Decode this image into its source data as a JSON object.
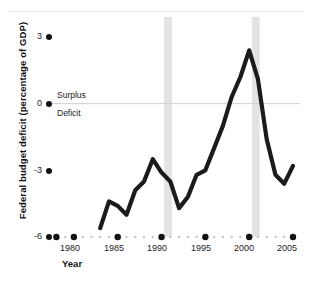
{
  "chart_data": {
    "type": "line",
    "title": "",
    "xlabel": "Year",
    "ylabel": "Federal budget deficit (percentage of GDP)",
    "xlim": [
      1977.5,
      2005.8
    ],
    "ylim": [
      -6,
      3
    ],
    "grid": false,
    "legend": "none",
    "yticks": [
      3,
      0,
      -3,
      -6
    ],
    "ytick_labels": [
      "3",
      "0",
      "-3",
      "-6"
    ],
    "xticks": [
      1980,
      1985,
      1990,
      1995,
      2000,
      2005
    ],
    "xtick_labels": [
      "1980",
      "1985",
      "1990",
      "1995",
      "2000",
      "2005"
    ],
    "zero_line": 0,
    "annotations": [
      {
        "text": "Surplus",
        "x": 1982,
        "y": 0.55
      },
      {
        "text": "Deficit",
        "x": 1982,
        "y": -0.75
      }
    ],
    "shaded_bands": [
      {
        "label": "recession",
        "x0": 1990.3,
        "x1": 1991.2,
        "color": "#e3e3e3"
      },
      {
        "label": "recession",
        "x0": 2000.3,
        "x1": 2001.2,
        "color": "#e3e3e3"
      }
    ],
    "series": [
      {
        "name": "Federal budget deficit",
        "color": "#1b1b1b",
        "x": [
          1983,
          1984,
          1985,
          1986,
          1987,
          1988,
          1989,
          1990,
          1991,
          1992,
          1993,
          1994,
          1995,
          1996,
          1997,
          1998,
          1999,
          2000,
          2001,
          2002,
          2003,
          2004,
          2005
        ],
        "values": [
          -5.6,
          -4.4,
          -4.6,
          -5.0,
          -3.9,
          -3.5,
          -2.5,
          -3.1,
          -3.5,
          -4.7,
          -4.2,
          -3.2,
          -3.0,
          -2.0,
          -1.0,
          0.3,
          1.2,
          2.4,
          1.1,
          -1.6,
          -3.2,
          -3.6,
          -2.8
        ]
      }
    ]
  },
  "axis": {
    "x_dot_color": "#111111",
    "x_minor_dot_color": "#c9c9c9"
  }
}
